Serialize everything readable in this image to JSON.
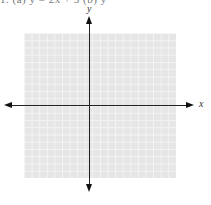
{
  "header": {
    "clipped_text": "1.  (a)  y = 2x + 3      (b)  y"
  },
  "diagram": {
    "type": "coordinate-plane",
    "grid": {
      "columns": 20,
      "rows": 20,
      "color": "#e6e6e6",
      "line_color": "#f4f4f4"
    },
    "axes": {
      "x_label": "x",
      "y_label": "y",
      "color": "#222222",
      "arrows": [
        "left",
        "right",
        "up",
        "down"
      ]
    }
  }
}
